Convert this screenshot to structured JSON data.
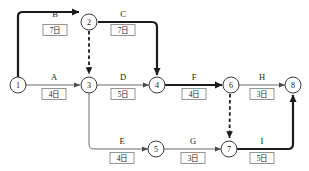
{
  "diagram": {
    "type": "activity-on-arrow-network",
    "title": "",
    "duration_unit": "日",
    "nodes": [
      {
        "id": "1",
        "label": "1",
        "x": 18,
        "y": 85
      },
      {
        "id": "2",
        "label": "2",
        "x": 89,
        "y": 22
      },
      {
        "id": "3",
        "label": "3",
        "x": 89,
        "y": 85
      },
      {
        "id": "4",
        "label": "4",
        "x": 157,
        "y": 85
      },
      {
        "id": "5",
        "label": "5",
        "x": 156,
        "y": 149
      },
      {
        "id": "6",
        "label": "6",
        "x": 231,
        "y": 85
      },
      {
        "id": "7",
        "label": "7",
        "x": 229,
        "y": 149
      },
      {
        "id": "8",
        "label": "8",
        "x": 293,
        "y": 85
      }
    ],
    "activities": [
      {
        "name": "B",
        "duration": "7日",
        "from": "1",
        "to": "2",
        "critical": true,
        "name_x": 55,
        "name_y": 17,
        "box_x": 55,
        "box_y": 32
      },
      {
        "name": "C",
        "duration": "7日",
        "from": "2",
        "to": "4",
        "critical": true,
        "name_x": 123,
        "name_y": 17,
        "box_x": 123,
        "box_y": 32
      },
      {
        "name": "A",
        "duration": "4日",
        "from": "1",
        "to": "3",
        "critical": false,
        "name_x": 54,
        "name_y": 80,
        "box_x": 54,
        "box_y": 96
      },
      {
        "name": "D",
        "duration": "5日",
        "from": "3",
        "to": "4",
        "critical": false,
        "name_x": 123,
        "name_y": 80,
        "box_x": 123,
        "box_y": 96
      },
      {
        "name": "F",
        "duration": "4日",
        "from": "4",
        "to": "6",
        "critical": true,
        "name_x": 194,
        "name_y": 80,
        "box_x": 194,
        "box_y": 96
      },
      {
        "name": "H",
        "duration": "3日",
        "from": "6",
        "to": "8",
        "critical": false,
        "name_x": 262,
        "name_y": 80,
        "box_x": 262,
        "box_y": 96
      },
      {
        "name": "E",
        "duration": "4日",
        "from": "3",
        "to": "5",
        "critical": false,
        "name_x": 122,
        "name_y": 144,
        "box_x": 122,
        "box_y": 160
      },
      {
        "name": "G",
        "duration": "3日",
        "from": "5",
        "to": "7",
        "critical": false,
        "name_x": 193,
        "name_y": 144,
        "box_x": 193,
        "box_y": 160
      },
      {
        "name": "I",
        "duration": "5日",
        "from": "7",
        "to": "8",
        "critical": true,
        "name_x": 262,
        "name_y": 144,
        "box_x": 262,
        "box_y": 160
      }
    ],
    "dummy_activities": [
      {
        "from": "2",
        "to": "3",
        "critical": false
      },
      {
        "from": "6",
        "to": "7",
        "critical": true
      }
    ],
    "colors": {
      "background": "#ffffff",
      "node_stroke": "#3a3a3a",
      "edge_normal": "#6a6a6a",
      "edge_critical": "#1c1c1c",
      "text": "#1a1a1a"
    }
  }
}
